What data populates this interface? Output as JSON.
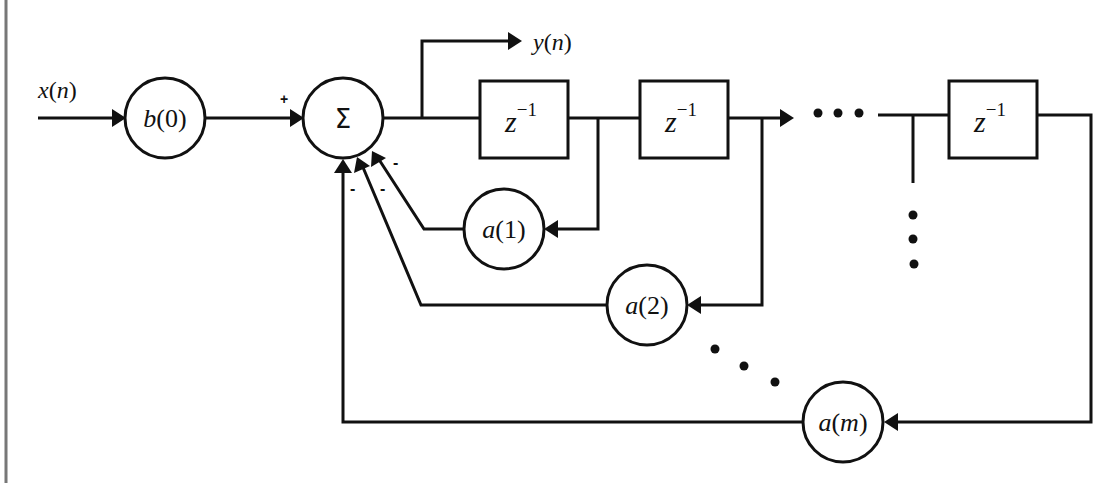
{
  "diagram": {
    "type": "IIR filter block diagram (direct form, feedback)",
    "input": {
      "label": "x(n)",
      "var": "x",
      "arg": "n"
    },
    "output": {
      "label": "y(n)",
      "var": "y",
      "arg": "n"
    },
    "gain": {
      "label": "b(0)",
      "var": "b",
      "arg": "0"
    },
    "summer": {
      "symbol": "Σ",
      "input_signs": {
        "feedforward": "+",
        "feedback": [
          "-",
          "-",
          "-"
        ]
      }
    },
    "delays": [
      {
        "label": "z",
        "exp": "−1"
      },
      {
        "label": "z",
        "exp": "−1"
      },
      {
        "label": "z",
        "exp": "−1"
      }
    ],
    "feedback_gains": [
      {
        "label": "a(1)",
        "var": "a",
        "arg": "1"
      },
      {
        "label": "a(2)",
        "var": "a",
        "arg": "2"
      },
      {
        "label": "a(m)",
        "var": "a",
        "arg": "m"
      }
    ],
    "ellipsis": "•••"
  },
  "colors": {
    "line": "#111111",
    "background": "#ffffff",
    "frame": "#777777"
  }
}
